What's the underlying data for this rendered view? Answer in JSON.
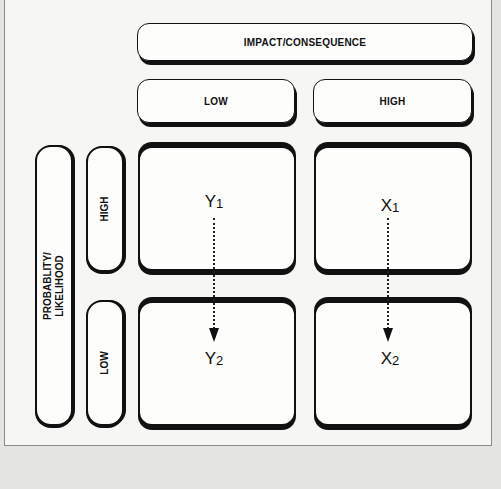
{
  "diagram": {
    "title_axis": {
      "label": "IMPACT/CONSEQUENCE"
    },
    "columns": [
      {
        "label": "LOW"
      },
      {
        "label": "HIGH"
      }
    ],
    "row_axis": {
      "line1": "PROBABLITY/",
      "line2": "LIKELIHOOD"
    },
    "rows": [
      {
        "label": "HIGH"
      },
      {
        "label": "LOW"
      }
    ],
    "points": {
      "y1": {
        "base": "Y",
        "sub": "1"
      },
      "y2": {
        "base": "Y",
        "sub": "2"
      },
      "x1": {
        "base": "X",
        "sub": "1"
      },
      "x2": {
        "base": "X",
        "sub": "2"
      }
    },
    "arrows": [
      {
        "from": "Y1",
        "to": "Y2",
        "style": "dotted"
      },
      {
        "from": "X1",
        "to": "X2",
        "style": "dotted"
      }
    ],
    "colors": {
      "stroke": "#111111",
      "box_fill": "#fdfdfc",
      "background": "#f6f6f4"
    }
  }
}
